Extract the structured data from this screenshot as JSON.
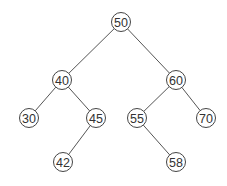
{
  "diagram": {
    "type": "binary-search-tree",
    "colors": {
      "background": "#ffffff",
      "edge": "#555555",
      "node_stroke": "#444444",
      "node_fill": "#ffffff",
      "label": "#333333"
    },
    "node_radius": 9.5,
    "nodes": [
      {
        "id": "n50",
        "label": "50",
        "x": 121,
        "y": 22
      },
      {
        "id": "n40",
        "label": "40",
        "x": 62,
        "y": 80
      },
      {
        "id": "n60",
        "label": "60",
        "x": 176,
        "y": 80
      },
      {
        "id": "n30",
        "label": "30",
        "x": 29,
        "y": 118
      },
      {
        "id": "n45",
        "label": "45",
        "x": 96,
        "y": 118
      },
      {
        "id": "n55",
        "label": "55",
        "x": 137,
        "y": 118
      },
      {
        "id": "n70",
        "label": "70",
        "x": 206,
        "y": 118
      },
      {
        "id": "n42",
        "label": "42",
        "x": 63,
        "y": 162
      },
      {
        "id": "n58",
        "label": "58",
        "x": 176,
        "y": 162
      }
    ],
    "edges": [
      {
        "from": "n50",
        "to": "n40"
      },
      {
        "from": "n50",
        "to": "n60"
      },
      {
        "from": "n40",
        "to": "n30"
      },
      {
        "from": "n40",
        "to": "n45"
      },
      {
        "from": "n45",
        "to": "n42"
      },
      {
        "from": "n60",
        "to": "n55"
      },
      {
        "from": "n60",
        "to": "n70"
      },
      {
        "from": "n55",
        "to": "n58"
      }
    ]
  }
}
